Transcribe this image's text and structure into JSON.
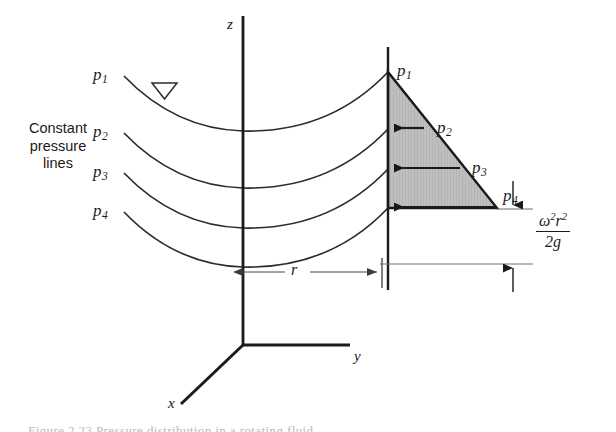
{
  "figure": {
    "domain": "diagram",
    "background_color": "#ffffff",
    "line_color": "#1a1a1a",
    "shade_color": "#bfbfbf",
    "width": 616,
    "height": 432
  },
  "labels": {
    "constant_pressure_lines": "Constant\npressure\nlines",
    "constant_line_1": "Constant",
    "constant_line_2": "pressure",
    "constant_line_3": "lines"
  },
  "axes": {
    "z": "z",
    "y": "y",
    "x": "x"
  },
  "curve_labels": [
    {
      "name": "p1",
      "base": "p",
      "sub": "1"
    },
    {
      "name": "p2",
      "base": "p",
      "sub": "2"
    },
    {
      "name": "p3",
      "base": "p",
      "sub": "3"
    },
    {
      "name": "p4",
      "base": "p",
      "sub": "4"
    }
  ],
  "pressure_labels": [
    {
      "name": "p1",
      "base": "p",
      "sub": "1"
    },
    {
      "name": "p2",
      "base": "p",
      "sub": "2"
    },
    {
      "name": "p3",
      "base": "p",
      "sub": "3"
    },
    {
      "name": "p4",
      "base": "p",
      "sub": "4"
    }
  ],
  "dimensions": {
    "radius": "r",
    "height_numerator_base": "ω",
    "height_numerator_exp1": "2",
    "height_numerator_var": "r",
    "height_numerator_exp2": "2",
    "height_denominator": "2g",
    "height_formula": "ω²r²/2g"
  },
  "caption": {
    "text": "Figure  2.23  Pressure distribution in a rotating fluid."
  },
  "markers": {
    "free_surface": "free-surface-triangle"
  }
}
